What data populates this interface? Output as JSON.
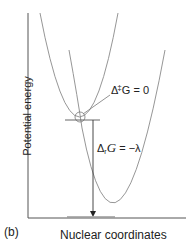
{
  "figure": {
    "panel_label": "(b)",
    "y_axis_label": "Potential energy",
    "x_axis_label": "Nuclear coordinates",
    "annotations": {
      "activation": {
        "delta": "Δ",
        "sup": "‡",
        "rest": "G = 0"
      },
      "reaction": {
        "delta": "Δ",
        "sub": "r",
        "g": "G",
        "rest": " = −λ"
      }
    },
    "curves": [
      {
        "name": "reactant-parabola",
        "vertex": [
          80,
          117
        ]
      },
      {
        "name": "product-parabola",
        "vertex": [
          117,
          217
        ]
      }
    ],
    "colors": {
      "curve": "#8a8a8a",
      "axis": "#555555",
      "text": "#222222"
    }
  }
}
